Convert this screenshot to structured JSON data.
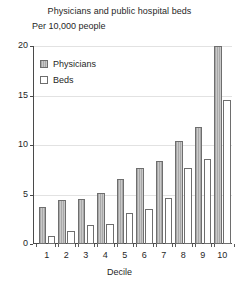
{
  "chart_data": {
    "type": "bar",
    "title": "Physicians and public hospital beds",
    "subtitle": "Per 10,000 people",
    "xlabel": "Decile",
    "ylabel": "",
    "categories": [
      "1",
      "2",
      "3",
      "4",
      "5",
      "6",
      "7",
      "8",
      "9",
      "10"
    ],
    "series": [
      {
        "name": "Physicians",
        "values": [
          3.7,
          4.4,
          4.5,
          5.2,
          6.6,
          7.7,
          8.4,
          10.4,
          11.8,
          20.0
        ],
        "color": "#b4b4b4"
      },
      {
        "name": "Beds",
        "values": [
          0.8,
          1.3,
          1.9,
          2.0,
          3.1,
          3.5,
          4.6,
          7.7,
          8.6,
          14.5
        ],
        "color": "#ffffff"
      }
    ],
    "ylim": [
      0,
      20
    ],
    "yticks": [
      0,
      5,
      10,
      15,
      20
    ],
    "ytick_labels": [
      "0",
      "5",
      "10",
      "15",
      "20"
    ],
    "grid": true,
    "legend_position": "top-left"
  },
  "legend": {
    "items": [
      {
        "label": "Physicians"
      },
      {
        "label": "Beds"
      }
    ]
  }
}
